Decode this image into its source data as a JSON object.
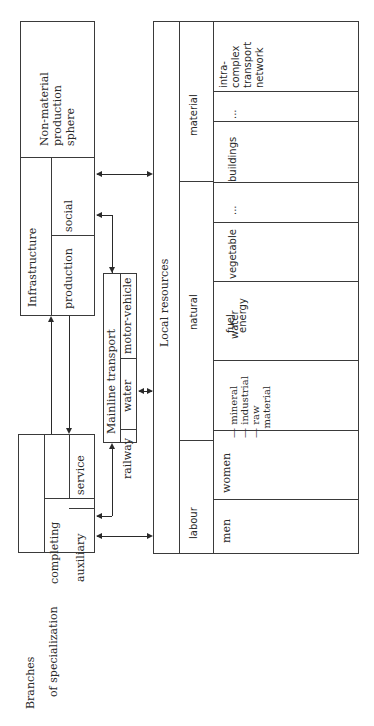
{
  "diagram": {
    "orientation": "rotated-90-ccw",
    "left_blocks": {
      "non_material": {
        "label": "Non-material\nproduction\nsphere"
      },
      "infrastructure": {
        "label": "Infrastructure",
        "children": [
          {
            "label": "social"
          },
          {
            "label": "production"
          }
        ]
      },
      "branches": {
        "label": "Branches",
        "sublabel": "of specialization",
        "children": [
          {
            "label": "completing",
            "children": [
              {
                "label": "auxiliary"
              },
              {
                "label": "service"
              }
            ]
          }
        ]
      }
    },
    "mainline_transport": {
      "label": "Mainline transport",
      "modes": [
        {
          "label": "railway"
        },
        {
          "label": "water"
        },
        {
          "label": "motor-vehicle"
        }
      ]
    },
    "local_resources": {
      "label": "Local resources",
      "groups": [
        {
          "label": "labour",
          "items": [
            {
              "label": "men"
            },
            {
              "label": "women"
            }
          ]
        },
        {
          "label": "natural",
          "items": [
            {
              "label": "— mineral\n— industrial\n— raw\n   material"
            },
            {
              "label": "fuel\nenergy"
            },
            {
              "label": "water"
            },
            {
              "label": "vegetable"
            },
            {
              "label": "..."
            },
            {
              "label": "land"
            }
          ]
        },
        {
          "label": "material",
          "items": [
            {
              "label": "buildings"
            },
            {
              "label": "..."
            },
            {
              "label": "intra-\ncomplex\ntransport\nnetwork"
            }
          ]
        }
      ]
    },
    "connections": [
      {
        "from": "non_material",
        "to": "local_resources",
        "type": "bidirectional"
      },
      {
        "from": "mainline_transport",
        "to": "infrastructure.social",
        "type": "bidirectional"
      },
      {
        "from": "branches",
        "to": "infrastructure.production",
        "type": "bidirectional"
      },
      {
        "from": "mainline_transport",
        "to": "local_resources",
        "type": "bidirectional"
      },
      {
        "from": "mainline_transport",
        "to": "branches",
        "type": "bidirectional"
      },
      {
        "from": "branches",
        "to": "local_resources",
        "type": "bidirectional"
      }
    ],
    "colors": {
      "line": "#3a3a3a",
      "text": "#2a2a2a",
      "background": "#ffffff"
    }
  }
}
